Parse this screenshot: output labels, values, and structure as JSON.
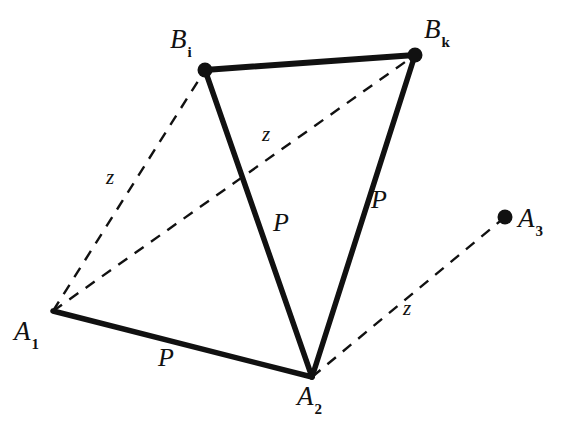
{
  "figure": {
    "type": "diagram",
    "background_color": "#ffffff",
    "stroke_color": "#111111",
    "canvas": {
      "width": 571,
      "height": 424
    }
  },
  "nodes": [
    {
      "id": "B_i",
      "name": "node-bi",
      "base": "B",
      "subscript": "i",
      "x": 205,
      "y": 70,
      "dot": true,
      "dot_radius": 7,
      "label_x": 170,
      "label_y": 26
    },
    {
      "id": "B_k",
      "name": "node-bk",
      "base": "B",
      "subscript": "k",
      "x": 415,
      "y": 55,
      "dot": true,
      "dot_radius": 7,
      "label_x": 424,
      "label_y": 16
    },
    {
      "id": "A_1",
      "name": "node-a1",
      "base": "A",
      "subscript": "1",
      "x": 53,
      "y": 311,
      "dot": false,
      "dot_radius": 0,
      "label_x": 14,
      "label_y": 318
    },
    {
      "id": "A_2",
      "name": "node-a2",
      "base": "A",
      "subscript": "2",
      "x": 312,
      "y": 377,
      "dot": false,
      "dot_radius": 0,
      "label_x": 297,
      "label_y": 383
    },
    {
      "id": "A_3",
      "name": "node-a3",
      "base": "A",
      "subscript": "3",
      "x": 505,
      "y": 217,
      "dot": true,
      "dot_radius": 7,
      "label_x": 518,
      "label_y": 205
    }
  ],
  "edges": [
    {
      "name": "edge-bi-bk",
      "from": "B_i",
      "to": "B_k",
      "style": "solid",
      "label": ""
    },
    {
      "name": "edge-bi-a2",
      "from": "B_i",
      "to": "A_2",
      "style": "solid",
      "label": "P"
    },
    {
      "name": "edge-bk-a2",
      "from": "B_k",
      "to": "A_2",
      "style": "solid",
      "label": "P"
    },
    {
      "name": "edge-a1-a2",
      "from": "A_1",
      "to": "A_2",
      "style": "solid",
      "label": "P"
    },
    {
      "name": "edge-a1-bi",
      "from": "A_1",
      "to": "B_i",
      "style": "dashed",
      "label": "z"
    },
    {
      "name": "edge-a1-bk",
      "from": "A_1",
      "to": "B_k",
      "style": "dashed",
      "label": "z"
    },
    {
      "name": "edge-a2-a3",
      "from": "A_2",
      "to": "A_3",
      "style": "dashed",
      "label": "z"
    }
  ],
  "edge_labels": [
    {
      "name": "edge-label-p-center",
      "text": "P",
      "x": 273,
      "y": 210
    },
    {
      "name": "edge-label-p-right",
      "text": "P",
      "x": 371,
      "y": 187
    },
    {
      "name": "edge-label-p-bottom",
      "text": "P",
      "x": 158,
      "y": 345
    },
    {
      "name": "edge-label-z-left",
      "text": "z",
      "x": 106,
      "y": 167
    },
    {
      "name": "edge-label-z-center",
      "text": "z",
      "x": 262,
      "y": 124
    },
    {
      "name": "edge-label-z-right",
      "text": "z",
      "x": 403,
      "y": 298
    }
  ],
  "geometry": {
    "solid_stroke_width": 5.5,
    "dashed_stroke_width": 2.4,
    "dash_pattern": "11 9"
  }
}
